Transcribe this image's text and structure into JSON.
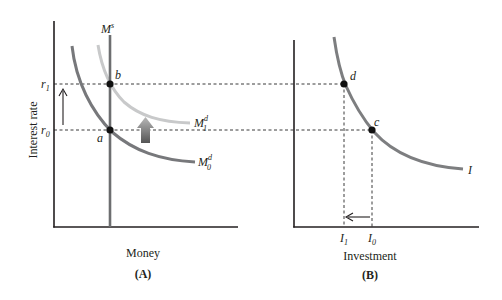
{
  "figure": {
    "panels": [
      {
        "id": "A",
        "caption": "(A)",
        "xlabel": "Money",
        "ylabel": "Interest rate",
        "y_ticks": [
          {
            "base": "r",
            "sub": "1"
          },
          {
            "base": "r",
            "sub": "0"
          }
        ],
        "curves": {
          "money_supply": {
            "base": "M",
            "sup": "s"
          },
          "money_demand_new": {
            "base": "M",
            "sup": "d",
            "sub": "1"
          },
          "money_demand_old": {
            "base": "M",
            "sup": "d",
            "sub": "0"
          }
        },
        "points": {
          "b": "b",
          "a": "a"
        },
        "arrows": {
          "rate_up": "up-arrow",
          "demand_shift": "shift-up-arrow"
        }
      },
      {
        "id": "B",
        "caption": "(B)",
        "xlabel": "Investment",
        "x_ticks": [
          {
            "base": "I",
            "sub": "1"
          },
          {
            "base": "I",
            "sub": "0"
          }
        ],
        "curves": {
          "investment": {
            "base": "I"
          }
        },
        "points": {
          "d": "d",
          "c": "c"
        },
        "arrows": {
          "investment_down": "left-arrow"
        }
      }
    ],
    "colors": {
      "axis": "#231f20",
      "money_supply": "#6d6e70",
      "money_demand_old": "#77787b",
      "money_demand_new": "#c8c9ca",
      "investment_curve": "#7d7e80",
      "dash": "#3a3a3a",
      "shift_arrow_top": "#b3b3b3",
      "shift_arrow_bottom": "#5a5a5a"
    }
  }
}
